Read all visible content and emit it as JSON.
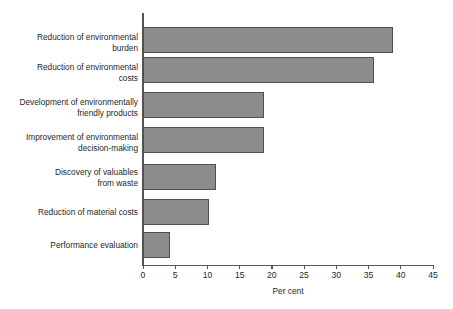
{
  "chart_data": {
    "type": "bar",
    "orientation": "horizontal",
    "title": "",
    "xlabel": "Per cent",
    "ylabel": "",
    "xlim": [
      0,
      45
    ],
    "xticks": [
      0,
      5,
      10,
      15,
      20,
      25,
      30,
      35,
      40,
      45
    ],
    "xtick_labels": [
      "0",
      "5",
      "10",
      "15",
      "20",
      "25",
      "30",
      "35",
      "40",
      "45"
    ],
    "grid": false,
    "legend": false,
    "bar_color": "#8c8c8c",
    "bar_edge_color": "#4f4f4f",
    "axis_color": "#555555",
    "background": "#ffffff",
    "categories": [
      "Reduction of environmental\nburden",
      "Reduction of environmental\ncosts",
      "Development of environmentally\nfriendly products",
      "Improvement of environmental\ndecision-making",
      "Discovery of valuables\nfrom waste",
      "Reduction of material costs",
      "Performance evaluation"
    ],
    "values": [
      38.8,
      35.8,
      18.7,
      18.7,
      11.4,
      10.3,
      4.2
    ]
  }
}
